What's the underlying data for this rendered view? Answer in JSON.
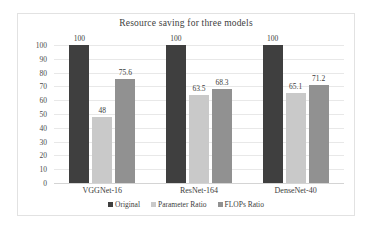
{
  "chart_data": {
    "type": "bar",
    "title": "Resource saving for three models",
    "xlabel": "",
    "ylabel": "",
    "ylim": [
      0,
      100
    ],
    "yticks": [
      100,
      90,
      80,
      70,
      60,
      50,
      40,
      30,
      20,
      10,
      0
    ],
    "grid": true,
    "legend_position": "bottom",
    "categories": [
      "VGGNet-16",
      "ResNet-164",
      "DenseNet-40"
    ],
    "series": [
      {
        "name": "Original",
        "color": "#3f3f3f",
        "values": [
          100,
          100,
          100
        ],
        "labels": [
          "100",
          "100",
          "100"
        ]
      },
      {
        "name": "Parameter Ratio",
        "color": "#c9c9c9",
        "values": [
          48,
          63.5,
          65.1
        ],
        "labels": [
          "48",
          "63.5",
          "65.1"
        ]
      },
      {
        "name": "FLOPs Ratio",
        "color": "#919191",
        "values": [
          75.6,
          68.3,
          71.2
        ],
        "labels": [
          "75.6",
          "68.3",
          "71.2"
        ]
      }
    ]
  }
}
